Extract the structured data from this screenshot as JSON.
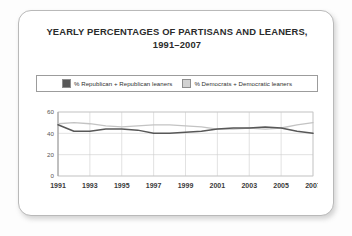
{
  "card": {
    "title_line1": "YEARLY PERCENTAGES OF PARTISANS AND LEANERS,",
    "title_line2": "1991–2007"
  },
  "legend": {
    "position": "top",
    "items": [
      {
        "label": "% Republican + Republican leaners",
        "color": "#585858",
        "swatch_name": "legend-swatch-republican"
      },
      {
        "label": "% Democrats + Democratic leaners",
        "color": "#cfcfcf",
        "swatch_name": "legend-swatch-democrat"
      }
    ]
  },
  "chart_data": {
    "type": "line",
    "title": "YEARLY PERCENTAGES OF PARTISANS AND LEANERS, 1991–2007",
    "xlabel": "",
    "ylabel": "",
    "grid": true,
    "legend_position": "top",
    "ylim": [
      0,
      60
    ],
    "yticks": [
      0,
      20,
      40,
      60
    ],
    "ytick_labels": [
      "0",
      "20",
      "40",
      "60"
    ],
    "xlim": [
      1991,
      2007
    ],
    "xticks": [
      1991,
      1993,
      1995,
      1997,
      1999,
      2001,
      2003,
      2005,
      2007
    ],
    "xtick_labels": [
      "1991",
      "1993",
      "1995",
      "1997",
      "1999",
      "2001",
      "2003",
      "2005",
      "2007"
    ],
    "x": [
      1991,
      1992,
      1993,
      1994,
      1995,
      1996,
      1997,
      1998,
      1999,
      2000,
      2001,
      2002,
      2003,
      2004,
      2005,
      2006,
      2007
    ],
    "series": [
      {
        "name": "% Republican + Republican leaners",
        "color": "#585858",
        "values": [
          48,
          42,
          42,
          44,
          44,
          43,
          40,
          40,
          41,
          42,
          44,
          45,
          45,
          46,
          45,
          42,
          40
        ]
      },
      {
        "name": "% Democrats + Democratic leaners",
        "color": "#c3c3c3",
        "values": [
          49,
          50,
          49,
          47,
          46,
          47,
          48,
          48,
          47,
          46,
          44,
          44,
          45,
          44,
          45,
          48,
          50
        ]
      }
    ]
  },
  "axis": {
    "ytick_labels": [
      "60",
      "40",
      "20",
      "0"
    ],
    "xtick_labels": [
      "1991",
      "1993",
      "1995",
      "1997",
      "1999",
      "2001",
      "2003",
      "2005",
      "2007"
    ]
  }
}
